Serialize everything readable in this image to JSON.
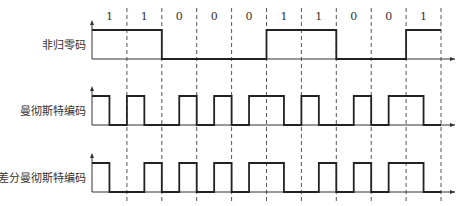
{
  "bits": [
    "1",
    "1",
    "0",
    "0",
    "0",
    "1",
    "1",
    "0",
    "0",
    "1"
  ],
  "rows": [
    {
      "label": "非归零码",
      "high": 30,
      "low": 59,
      "levels": [
        1,
        1,
        1,
        1,
        0,
        0,
        0,
        0,
        0,
        0,
        1,
        1,
        1,
        1,
        0,
        0,
        0,
        0,
        1,
        1
      ]
    },
    {
      "label": "曼彻斯特编码",
      "high": 96,
      "low": 125,
      "levels": [
        1,
        0,
        1,
        0,
        0,
        1,
        0,
        1,
        0,
        1,
        1,
        0,
        1,
        0,
        0,
        1,
        0,
        1,
        1,
        0
      ]
    },
    {
      "label": "差分曼彻斯特编码",
      "high": 163,
      "low": 192,
      "levels": [
        1,
        0,
        0,
        1,
        0,
        1,
        0,
        1,
        0,
        1,
        1,
        0,
        0,
        1,
        0,
        1,
        0,
        1,
        1,
        0
      ]
    }
  ],
  "layout": {
    "x0": 92,
    "bitWidth": 34.9,
    "axisEnd": 455
  },
  "colors": {
    "signal": "#222222",
    "axis": "#333333",
    "dash": "#555555"
  }
}
